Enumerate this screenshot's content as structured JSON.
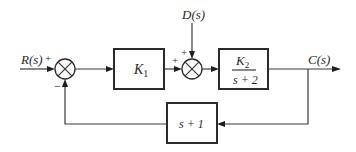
{
  "diagram": {
    "type": "block-diagram",
    "signals": {
      "input": "R(s)",
      "disturbance": "D(s)",
      "output": "C(s)"
    },
    "blocks": {
      "controller": {
        "label_main": "K",
        "label_sub": "1"
      },
      "plant": {
        "numerator_main": "K",
        "numerator_sub": "2",
        "denominator": "s + 2"
      },
      "feedback": {
        "label": "s + 1"
      }
    },
    "summing_junctions": {
      "first": {
        "input_sign": "+",
        "feedback_sign": "−"
      },
      "second": {
        "left_sign": "+",
        "top_sign": "+"
      }
    }
  }
}
